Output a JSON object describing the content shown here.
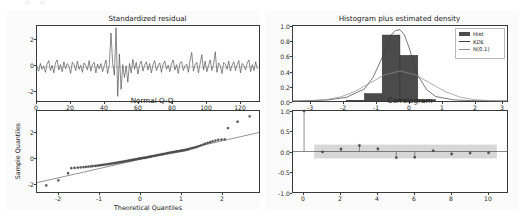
{
  "figure": {
    "background_color": "#ffffff",
    "axis_color": "#3a3a3a",
    "line_color": "#4a4a4a",
    "marker_color": "#555555",
    "hist_color": "#4b4b4b",
    "band_color": "#c9c9c9"
  },
  "panels": {
    "standardized_residual": {
      "title": "Standardized residual",
      "xlabel": "",
      "ylabel": "",
      "xticks": [
        "0",
        "20",
        "40",
        "60",
        "80",
        "100",
        "120"
      ],
      "yticks": [
        "-2",
        "0",
        "2"
      ]
    },
    "histogram": {
      "title": "Histogram plus estimated density",
      "xlabel": "",
      "ylabel": "",
      "xticks": [
        "-3",
        "-2",
        "-1",
        "0",
        "1",
        "2",
        "3"
      ],
      "yticks": [
        "0.0",
        "0.2",
        "0.4",
        "0.6",
        "0.8",
        "1.0"
      ],
      "legend": [
        {
          "label": "Hist",
          "kind": "patch"
        },
        {
          "label": "KDE",
          "kind": "line"
        },
        {
          "label": "N(0,1)",
          "kind": "line"
        }
      ]
    },
    "normal_qq": {
      "title": "Normal Q-Q",
      "xlabel": "Theoretical Quantiles",
      "ylabel": "Sample Quantiles",
      "xticks": [
        "-2",
        "-1",
        "0",
        "1",
        "2"
      ],
      "yticks": [
        "-2",
        "0",
        "2"
      ]
    },
    "correlogram": {
      "title": "Correlogram",
      "xlabel": "",
      "ylabel": "",
      "xticks": [
        "0",
        "2",
        "4",
        "6",
        "8",
        "10"
      ],
      "yticks": [
        "-1.0",
        "-0.5",
        "0.0",
        "0.5",
        "1.0"
      ]
    }
  },
  "chart_data": [
    {
      "type": "line",
      "name": "standardized_residual",
      "title": "Standardized residual",
      "xlabel": "",
      "ylabel": "",
      "xlim": [
        0,
        132
      ],
      "ylim": [
        -2.9,
        3.5
      ],
      "grid": false,
      "xticks": [
        0,
        20,
        40,
        60,
        80,
        100,
        120
      ],
      "yticks": [
        -2,
        0,
        2
      ],
      "values": [
        0.05,
        -0.35,
        0.3,
        -0.2,
        0.1,
        -0.45,
        0.25,
        0.55,
        -0.3,
        0.15,
        -0.5,
        0.35,
        0.6,
        -0.25,
        0.2,
        -0.4,
        0.45,
        -0.15,
        0.3,
        0.05,
        -0.55,
        0.4,
        0.2,
        -0.3,
        0.5,
        -0.2,
        0.15,
        -0.45,
        0.35,
        0.1,
        -0.25,
        0.55,
        -0.35,
        0.2,
        0.4,
        -0.5,
        0.25,
        -0.15,
        0.3,
        -0.4,
        0.1,
        0.6,
        -0.55,
        0.2,
        2.9,
        0.3,
        -0.7,
        3.35,
        -2.5,
        1.1,
        -1.9,
        0.2,
        -0.9,
        0.1,
        -1.3,
        0.3,
        -0.5,
        0.65,
        -0.2,
        0.4,
        -0.6,
        0.2,
        0.5,
        -0.35,
        0.15,
        0.45,
        -0.25,
        0.3,
        -0.5,
        0.2,
        0.55,
        -0.3,
        0.1,
        0.35,
        -0.45,
        0.25,
        0.5,
        -0.2,
        0.15,
        -0.4,
        0.3,
        0.6,
        -0.25,
        0.2,
        -0.55,
        0.35,
        0.45,
        -0.3,
        0.1,
        0.25,
        -0.45,
        0.55,
        1.25,
        -0.35,
        0.2,
        0.4,
        -0.5,
        0.3,
        1.05,
        -0.25,
        0.5,
        -0.4,
        0.15,
        0.6,
        -0.3,
        0.2,
        1.3,
        -0.45,
        0.35,
        0.1,
        -0.55,
        0.4,
        0.25,
        -0.2,
        0.5,
        -0.35,
        0.15,
        0.45,
        -0.3,
        0.2,
        0.55,
        -0.5,
        0.3,
        0.1,
        -0.25,
        0.35,
        0.6,
        -0.4,
        0.2,
        -0.3,
        0.45,
        -0.15
      ]
    },
    {
      "type": "bar",
      "name": "histogram",
      "title": "Histogram plus estimated density",
      "xlabel": "",
      "ylabel": "",
      "xlim": [
        -3.6,
        3.6
      ],
      "ylim": [
        0.0,
        1.0
      ],
      "xticks": [
        -3,
        -2,
        -1,
        0,
        1,
        2,
        3
      ],
      "yticks": [
        0.0,
        0.2,
        0.4,
        0.6,
        0.8,
        1.0
      ],
      "bin_edges": [
        -3.0,
        -2.4,
        -1.8,
        -1.2,
        -0.6,
        0.0,
        0.6,
        1.2,
        1.8,
        2.4,
        3.0
      ],
      "values": [
        0.0,
        0.0,
        0.01,
        0.1,
        0.88,
        0.61,
        0.02,
        0.0,
        0.0,
        0.0
      ],
      "series": [
        {
          "name": "KDE",
          "type": "line",
          "x": [
            -3.6,
            -3.0,
            -2.4,
            -1.8,
            -1.2,
            -0.9,
            -0.6,
            -0.45,
            -0.3,
            -0.15,
            0.0,
            0.15,
            0.3,
            0.45,
            0.6,
            0.9,
            1.2,
            1.8,
            2.4,
            3.0,
            3.6
          ],
          "y": [
            0.0,
            0.005,
            0.015,
            0.05,
            0.16,
            0.32,
            0.58,
            0.74,
            0.88,
            0.94,
            0.95,
            0.88,
            0.72,
            0.52,
            0.34,
            0.15,
            0.06,
            0.015,
            0.005,
            0.002,
            0.0
          ]
        },
        {
          "name": "N(0,1)",
          "type": "line",
          "x": [
            -3.6,
            -3.0,
            -2.5,
            -2.0,
            -1.5,
            -1.0,
            -0.5,
            0.0,
            0.5,
            1.0,
            1.5,
            2.0,
            2.5,
            3.0,
            3.6
          ],
          "y": [
            0.0006,
            0.0044,
            0.0175,
            0.054,
            0.1295,
            0.242,
            0.3521,
            0.3989,
            0.3521,
            0.242,
            0.1295,
            0.054,
            0.0175,
            0.0044,
            0.0006
          ]
        }
      ]
    },
    {
      "type": "scatter",
      "name": "normal_qq",
      "title": "Normal Q-Q",
      "xlabel": "Theoretical Quantiles",
      "ylabel": "Sample Quantiles",
      "xlim": [
        -2.75,
        2.75
      ],
      "ylim": [
        -2.7,
        3.7
      ],
      "xticks": [
        -2,
        -1,
        0,
        1,
        2
      ],
      "yticks": [
        -2,
        0,
        2
      ],
      "reference_line": {
        "slope": 0.72,
        "intercept": 0.02
      },
      "x": [
        -2.52,
        -2.22,
        -1.98,
        -1.9,
        -1.82,
        -1.74,
        -1.67,
        -1.6,
        -1.54,
        -1.48,
        -1.42,
        -1.37,
        -1.31,
        -1.26,
        -1.21,
        -1.17,
        -1.12,
        -1.08,
        -1.03,
        -0.99,
        -0.95,
        -0.91,
        -0.87,
        -0.83,
        -0.8,
        -0.76,
        -0.72,
        -0.69,
        -0.65,
        -0.62,
        -0.58,
        -0.55,
        -0.51,
        -0.48,
        -0.45,
        -0.41,
        -0.38,
        -0.35,
        -0.32,
        -0.28,
        -0.25,
        -0.22,
        -0.19,
        -0.16,
        -0.12,
        -0.09,
        -0.06,
        -0.03,
        0.0,
        0.03,
        0.06,
        0.09,
        0.12,
        0.16,
        0.19,
        0.22,
        0.25,
        0.28,
        0.32,
        0.35,
        0.38,
        0.41,
        0.45,
        0.48,
        0.51,
        0.55,
        0.58,
        0.62,
        0.65,
        0.69,
        0.72,
        0.76,
        0.8,
        0.83,
        0.87,
        0.91,
        0.95,
        0.99,
        1.03,
        1.08,
        1.12,
        1.17,
        1.21,
        1.26,
        1.31,
        1.37,
        1.42,
        1.48,
        1.54,
        1.6,
        1.67,
        1.74,
        1.82,
        1.9,
        1.98,
        2.22,
        2.52
      ],
      "y": [
        -2.18,
        -1.78,
        -1.22,
        -0.82,
        -0.8,
        -0.78,
        -0.76,
        -0.74,
        -0.72,
        -0.7,
        -0.68,
        -0.66,
        -0.64,
        -0.62,
        -0.6,
        -0.58,
        -0.56,
        -0.54,
        -0.52,
        -0.5,
        -0.48,
        -0.46,
        -0.44,
        -0.42,
        -0.4,
        -0.38,
        -0.36,
        -0.34,
        -0.32,
        -0.3,
        -0.28,
        -0.26,
        -0.24,
        -0.22,
        -0.2,
        -0.18,
        -0.16,
        -0.14,
        -0.12,
        -0.1,
        -0.08,
        -0.06,
        -0.05,
        -0.03,
        -0.01,
        0.0,
        0.02,
        0.04,
        0.06,
        0.08,
        0.1,
        0.12,
        0.14,
        0.16,
        0.18,
        0.2,
        0.22,
        0.24,
        0.26,
        0.28,
        0.3,
        0.32,
        0.34,
        0.36,
        0.38,
        0.4,
        0.42,
        0.44,
        0.46,
        0.48,
        0.5,
        0.52,
        0.54,
        0.56,
        0.58,
        0.6,
        0.63,
        0.66,
        0.7,
        0.74,
        0.78,
        0.82,
        0.86,
        0.92,
        0.98,
        1.05,
        1.12,
        1.18,
        1.24,
        1.3,
        1.36,
        1.42,
        1.44,
        1.46,
        2.35,
        2.85,
        3.28
      ]
    },
    {
      "type": "line",
      "name": "correlogram",
      "title": "Correlogram",
      "xlabel": "",
      "ylabel": "",
      "xlim": [
        -0.6,
        11.0
      ],
      "ylim": [
        -1.0,
        1.0
      ],
      "xticks": [
        0,
        2,
        4,
        6,
        8,
        10
      ],
      "yticks": [
        -1.0,
        -0.5,
        0.0,
        0.5,
        1.0
      ],
      "lags": [
        0,
        1,
        2,
        3,
        4,
        5,
        6,
        7,
        8,
        9,
        10
      ],
      "values": [
        1.0,
        -0.01,
        0.06,
        0.15,
        0.07,
        -0.15,
        -0.14,
        0.02,
        -0.06,
        -0.04,
        -0.03
      ],
      "confidence_band": [
        0.17,
        -0.17
      ]
    }
  ]
}
